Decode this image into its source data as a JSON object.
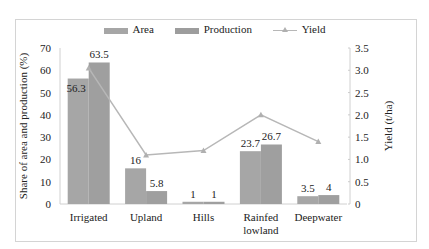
{
  "chart_data": {
    "type": "bar",
    "title": "",
    "categories": [
      "Irrigated",
      "Upland",
      "Hills",
      "Rainfed lowland",
      "Deepwater"
    ],
    "category_lines": [
      [
        "Irrigated"
      ],
      [
        "Upland"
      ],
      [
        "Hills"
      ],
      [
        "Rainfed",
        "lowland"
      ],
      [
        "Deepwater"
      ]
    ],
    "series": [
      {
        "name": "Area",
        "type": "bar",
        "axis": "left",
        "values": [
          56.3,
          16,
          1,
          23.7,
          3.5
        ],
        "color": "#a6a6a6"
      },
      {
        "name": "Production",
        "type": "bar",
        "axis": "left",
        "values": [
          63.5,
          5.8,
          1,
          26.7,
          4
        ],
        "color": "#a0a0a0"
      },
      {
        "name": "Yield",
        "type": "line",
        "axis": "right",
        "values": [
          3.05,
          1.1,
          1.2,
          2.0,
          1.4
        ],
        "color": "#b7b7b7",
        "marker": "triangle"
      }
    ],
    "xlabel": "",
    "ylabel": "Share of area and production (%)",
    "y2label": "Yield (t/ha)",
    "ylim": [
      0,
      70
    ],
    "y2lim": [
      0,
      3.5
    ],
    "yticks": [
      "0",
      "10",
      "20",
      "30",
      "40",
      "50",
      "60",
      "70"
    ],
    "y2ticks": [
      "0",
      "0.5",
      "1.0",
      "1.5",
      "2.0",
      "2.5",
      "3.0",
      "3.5"
    ],
    "grid": false,
    "legend_position": "top"
  },
  "legend": {
    "area": "Area",
    "production": "Production",
    "yield": "Yield"
  }
}
